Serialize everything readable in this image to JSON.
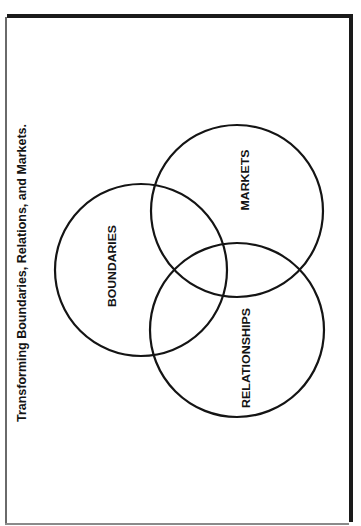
{
  "title": "Transforming Boundaries, Relations, and Markets.",
  "diagram": {
    "type": "venn",
    "orientation": "rotated-90-ccw",
    "circles": [
      {
        "label": "BOUNDARIES",
        "cx": 141,
        "cy": 270,
        "r": 86
      },
      {
        "label": "MARKETS",
        "cx": 237,
        "cy": 211,
        "r": 86
      },
      {
        "label": "RELATIONSHIPS",
        "cx": 237,
        "cy": 330,
        "r": 87
      }
    ]
  },
  "colors": {
    "ink": "#141414",
    "background": "#ffffff"
  }
}
